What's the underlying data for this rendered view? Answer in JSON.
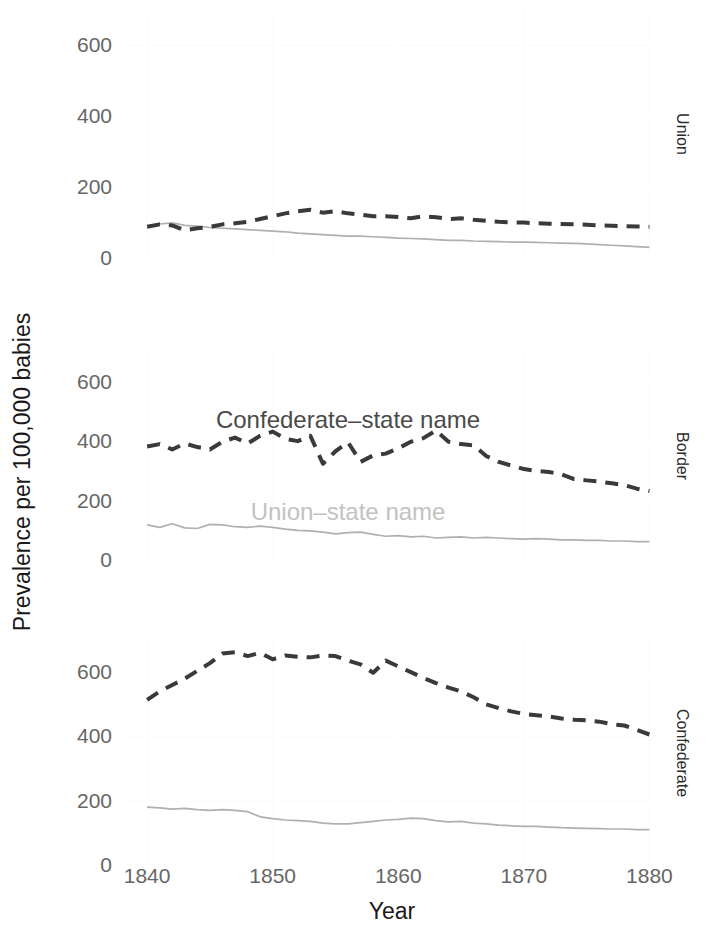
{
  "chart_data": {
    "type": "line",
    "title": "",
    "xlabel": "Year",
    "ylabel": "Prevalence per 100,000 babies",
    "xlim": [
      1838,
      1881
    ],
    "ylim": [
      0,
      700
    ],
    "xticks": [
      1840,
      1850,
      1860,
      1870,
      1880
    ],
    "yticks": [
      0,
      200,
      400,
      600
    ],
    "grid": true,
    "legend": "in-plot annotations",
    "facet_layout": "vertical, strip labels on right",
    "annotations": [
      {
        "text": "Confederate–state name",
        "panel": "Border",
        "color": "#4a4a4a",
        "x": 1856,
        "y": 470
      },
      {
        "text": "Union–state name",
        "panel": "Border",
        "color": "#c2c2c2",
        "x": 1856,
        "y": 160
      }
    ],
    "series_styles": [
      {
        "name": "Confederate–state name",
        "color": "#3a3a3a",
        "dash": "dashed",
        "width": 4
      },
      {
        "name": "Union–state name",
        "color": "#b0b0b0",
        "dash": "solid",
        "width": 1.7
      }
    ],
    "panels": [
      {
        "facet": "Union",
        "x": [
          1840,
          1841,
          1842,
          1843,
          1844,
          1845,
          1846,
          1847,
          1848,
          1849,
          1850,
          1851,
          1852,
          1853,
          1854,
          1855,
          1856,
          1857,
          1858,
          1859,
          1860,
          1861,
          1862,
          1863,
          1864,
          1865,
          1866,
          1867,
          1868,
          1869,
          1870,
          1871,
          1872,
          1873,
          1874,
          1875,
          1876,
          1877,
          1878,
          1879,
          1880
        ],
        "series": [
          {
            "name": "Confederate–state name",
            "values": [
              88,
              95,
              92,
              78,
              84,
              88,
              95,
              98,
              102,
              110,
              118,
              126,
              132,
              136,
              128,
              132,
              126,
              122,
              118,
              118,
              116,
              112,
              118,
              115,
              110,
              112,
              108,
              105,
              102,
              100,
              100,
              98,
              97,
              96,
              95,
              94,
              92,
              91,
              90,
              89,
              88
            ]
          },
          {
            "name": "Union–state name",
            "values": [
              90,
              96,
              99,
              92,
              90,
              86,
              84,
              82,
              80,
              78,
              76,
              74,
              70,
              68,
              66,
              64,
              62,
              62,
              60,
              58,
              56,
              55,
              54,
              52,
              50,
              50,
              48,
              47,
              46,
              45,
              45,
              44,
              43,
              42,
              41,
              40,
              38,
              36,
              34,
              32,
              30
            ]
          }
        ]
      },
      {
        "facet": "Border",
        "x": [
          1840,
          1841,
          1842,
          1843,
          1844,
          1845,
          1846,
          1847,
          1848,
          1849,
          1850,
          1851,
          1852,
          1853,
          1854,
          1855,
          1856,
          1857,
          1858,
          1859,
          1860,
          1861,
          1862,
          1863,
          1864,
          1865,
          1866,
          1867,
          1868,
          1869,
          1870,
          1871,
          1872,
          1873,
          1874,
          1875,
          1876,
          1877,
          1878,
          1879,
          1880
        ],
        "series": [
          {
            "name": "Confederate–state name",
            "values": [
              382,
              390,
              372,
              392,
              380,
              372,
              398,
              412,
              392,
              418,
              432,
              408,
              400,
              418,
              324,
              366,
              396,
              330,
              352,
              358,
              376,
              398,
              410,
              436,
              398,
              390,
              386,
              350,
              330,
              318,
              306,
              300,
              296,
              288,
              272,
              268,
              264,
              258,
              252,
              240,
              232
            ]
          },
          {
            "name": "Union–state name",
            "values": [
              118,
              110,
              122,
              108,
              106,
              120,
              118,
              112,
              110,
              114,
              110,
              104,
              100,
              98,
              94,
              88,
              92,
              94,
              86,
              80,
              82,
              78,
              80,
              74,
              76,
              78,
              74,
              76,
              74,
              72,
              70,
              72,
              70,
              68,
              68,
              66,
              66,
              64,
              64,
              62,
              62
            ]
          }
        ]
      },
      {
        "facet": "Confederate",
        "x": [
          1840,
          1841,
          1842,
          1843,
          1844,
          1845,
          1846,
          1847,
          1848,
          1849,
          1850,
          1851,
          1852,
          1853,
          1854,
          1855,
          1856,
          1857,
          1858,
          1859,
          1860,
          1861,
          1862,
          1863,
          1864,
          1865,
          1866,
          1867,
          1868,
          1869,
          1870,
          1871,
          1872,
          1873,
          1874,
          1875,
          1876,
          1877,
          1878,
          1879,
          1880
        ],
        "series": [
          {
            "name": "Confederate–state name",
            "values": [
              514,
              540,
              560,
              580,
              604,
              628,
              658,
              662,
              650,
              660,
              640,
              652,
              648,
              646,
              652,
              650,
              636,
              624,
              598,
              636,
              618,
              600,
              582,
              566,
              552,
              540,
              522,
              500,
              488,
              478,
              470,
              466,
              462,
              456,
              452,
              450,
              446,
              438,
              434,
              420,
              406
            ]
          },
          {
            "name": "Union–state name",
            "values": [
              180,
              178,
              174,
              176,
              172,
              170,
              172,
              170,
              166,
              150,
              144,
              140,
              138,
              136,
              130,
              128,
              128,
              132,
              136,
              140,
              142,
              146,
              144,
              138,
              134,
              136,
              130,
              128,
              124,
              122,
              120,
              120,
              118,
              116,
              115,
              114,
              113,
              112,
              112,
              110,
              110
            ]
          }
        ]
      }
    ]
  },
  "axis": {
    "x_title": "Year",
    "y_title": "Prevalence per 100,000 babies",
    "xtick_labels": [
      "1840",
      "1850",
      "1860",
      "1870",
      "1880"
    ],
    "ytick_labels": [
      "600",
      "400",
      "200",
      "0"
    ]
  },
  "strips": {
    "union": "Union",
    "border": "Border",
    "confederate": "Confederate"
  },
  "annotations": {
    "confederate_name": "Confederate–state name",
    "union_name": "Union–state name"
  },
  "colors": {
    "confederate_line": "#3a3a3a",
    "union_line": "#b0b0b0",
    "tick_text": "#666666",
    "axis_title": "#1a1a1a",
    "grid": "#fbfbfb"
  }
}
